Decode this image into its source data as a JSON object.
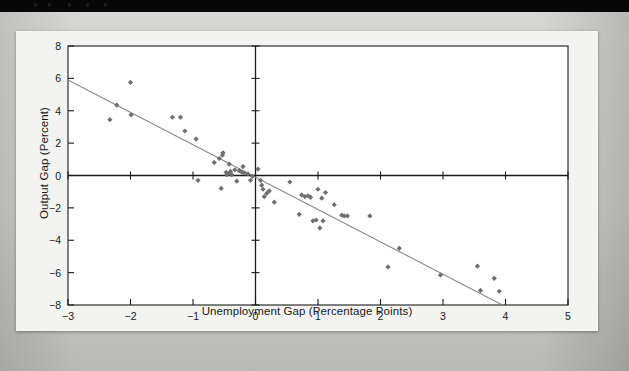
{
  "topbar": {
    "label": "black-title-strip"
  },
  "figure": {
    "background": "#f3f3f1",
    "plot_background": "#ffffff"
  },
  "chart_data": {
    "type": "scatter",
    "title": "",
    "subtitle": "",
    "xlabel": "Unemployment Gap (Percentage Points)",
    "ylabel": "Output Gap (Percent)",
    "xlim": [
      -3,
      5
    ],
    "ylim": [
      -8,
      8
    ],
    "xticks": [
      -3,
      -2,
      -1,
      0,
      1,
      2,
      3,
      4,
      5
    ],
    "xticklabels": [
      "−3",
      "−2",
      "−1",
      "0",
      "1",
      "2",
      "3",
      "4",
      "5"
    ],
    "yticks": [
      -8,
      -6,
      -4,
      -2,
      0,
      2,
      4,
      6,
      8
    ],
    "yticklabels": [
      "−8",
      "−6",
      "−4",
      "−2",
      "0",
      "2",
      "4",
      "6",
      "8"
    ],
    "grid": false,
    "legend": "none",
    "marker": "diamond",
    "marker_color": "#6f6f72",
    "axis_color": "#1b1b1b",
    "trendline_color": "#8a8a8a",
    "trendline": {
      "x": [
        -3,
        3.95
      ],
      "y": [
        5.9,
        -8.0
      ],
      "label": "fitted regression line"
    },
    "points": [
      [
        -2.33,
        3.45
      ],
      [
        -2.22,
        4.35
      ],
      [
        -2.0,
        5.75
      ],
      [
        -1.99,
        3.75
      ],
      [
        -1.33,
        3.6
      ],
      [
        -1.2,
        3.6
      ],
      [
        -1.13,
        2.75
      ],
      [
        -0.95,
        2.25
      ],
      [
        -0.92,
        -0.3
      ],
      [
        -0.66,
        0.8
      ],
      [
        -0.58,
        1.05
      ],
      [
        -0.52,
        1.4
      ],
      [
        -0.53,
        1.25
      ],
      [
        -0.55,
        -0.8
      ],
      [
        -0.47,
        0.2
      ],
      [
        -0.46,
        0.05
      ],
      [
        -0.44,
        0.12
      ],
      [
        -0.42,
        0.7
      ],
      [
        -0.4,
        0.25
      ],
      [
        -0.38,
        0.05
      ],
      [
        -0.33,
        0.35
      ],
      [
        -0.3,
        -0.35
      ],
      [
        -0.26,
        0.3
      ],
      [
        -0.22,
        0.2
      ],
      [
        -0.2,
        0.55
      ],
      [
        -0.18,
        0.15
      ],
      [
        -0.12,
        0.1
      ],
      [
        -0.08,
        -0.3
      ],
      [
        -0.05,
        -0.05
      ],
      [
        0.04,
        0.4
      ],
      [
        0.08,
        -0.3
      ],
      [
        0.1,
        -0.6
      ],
      [
        0.12,
        -0.85
      ],
      [
        0.14,
        -1.3
      ],
      [
        0.18,
        -1.1
      ],
      [
        0.22,
        -0.95
      ],
      [
        0.3,
        -1.65
      ],
      [
        0.55,
        -0.4
      ],
      [
        0.7,
        -2.4
      ],
      [
        0.74,
        -1.2
      ],
      [
        0.79,
        -1.3
      ],
      [
        0.84,
        -1.25
      ],
      [
        0.88,
        -1.35
      ],
      [
        0.92,
        -2.8
      ],
      [
        0.97,
        -2.75
      ],
      [
        1.0,
        -0.85
      ],
      [
        1.03,
        -3.25
      ],
      [
        1.06,
        -1.4
      ],
      [
        1.08,
        -2.8
      ],
      [
        1.12,
        -1.05
      ],
      [
        1.26,
        -1.8
      ],
      [
        1.38,
        -2.45
      ],
      [
        1.42,
        -2.5
      ],
      [
        1.47,
        -2.5
      ],
      [
        1.83,
        -2.5
      ],
      [
        2.12,
        -5.65
      ],
      [
        2.3,
        -4.5
      ],
      [
        2.96,
        -6.15
      ],
      [
        3.55,
        -5.6
      ],
      [
        3.6,
        -7.1
      ],
      [
        3.82,
        -6.35
      ],
      [
        3.9,
        -7.15
      ]
    ]
  }
}
